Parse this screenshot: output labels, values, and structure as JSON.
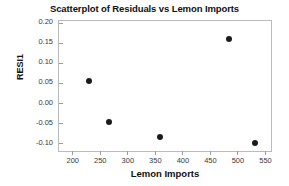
{
  "chart_data": {
    "type": "scatter",
    "title": "Scatterplot of Residuals vs Lemon Imports",
    "xlabel": "Lemon Imports",
    "ylabel": "RESI1",
    "xlim": [
      175,
      560
    ],
    "ylim": [
      -0.118,
      0.205
    ],
    "grid": false,
    "legend": null,
    "xticks": [
      200,
      250,
      300,
      350,
      400,
      450,
      500,
      550
    ],
    "xticklabels": [
      "200",
      "250",
      "300",
      "350",
      "400",
      "450",
      "500",
      "550"
    ],
    "yticks": [
      0.2,
      0.15,
      0.1,
      0.05,
      0.0,
      -0.05,
      -0.1
    ],
    "yticklabels": [
      "0.20",
      "0.15",
      "0.10",
      "0.05",
      "0.00",
      "-0.05",
      "-0.10"
    ],
    "marker": "filled-circle",
    "marker_color": "#1b1b1b",
    "points": [
      {
        "x": 230,
        "y": 0.056
      },
      {
        "x": 265,
        "y": -0.045
      },
      {
        "x": 358,
        "y": -0.082
      },
      {
        "x": 483,
        "y": 0.16
      },
      {
        "x": 531,
        "y": -0.098
      }
    ]
  },
  "colors": {
    "frame": "#b9bcbe",
    "tick": "#9a9d9f",
    "text": "#111111",
    "background": "#ffffff"
  }
}
